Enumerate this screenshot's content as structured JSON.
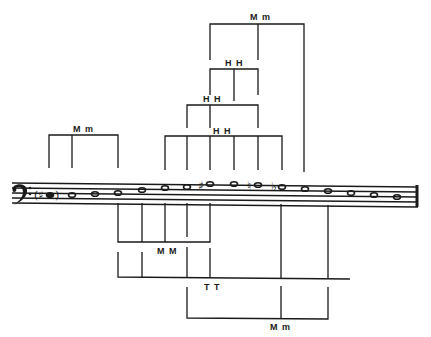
{
  "diagram": {
    "type": "music-interval-diagram",
    "clef": "bass",
    "ink_color": "#1a1a1a",
    "background": "#ffffff",
    "staff": {
      "x1": 12,
      "x2": 418,
      "lines_y": [
        183,
        188,
        193,
        198,
        203
      ]
    },
    "notes": [
      {
        "x": 50,
        "y": 195,
        "accidental": "(#)",
        "filled": true
      },
      {
        "x": 72,
        "y": 195,
        "accidental": ""
      },
      {
        "x": 95,
        "y": 194,
        "accidental": ""
      },
      {
        "x": 118,
        "y": 193,
        "accidental": ""
      },
      {
        "x": 142,
        "y": 191,
        "accidental": ""
      },
      {
        "x": 165,
        "y": 188,
        "accidental": ""
      },
      {
        "x": 187,
        "y": 187,
        "accidental": ""
      },
      {
        "x": 210,
        "y": 184,
        "accidental": "#"
      },
      {
        "x": 234,
        "y": 184,
        "accidental": ""
      },
      {
        "x": 258,
        "y": 185,
        "accidental": "natural"
      },
      {
        "x": 282,
        "y": 187,
        "accidental": "b"
      },
      {
        "x": 305,
        "y": 189,
        "accidental": ""
      },
      {
        "x": 328,
        "y": 191,
        "accidental": ""
      },
      {
        "x": 351,
        "y": 193,
        "accidental": ""
      },
      {
        "x": 374,
        "y": 195,
        "accidental": ""
      },
      {
        "x": 397,
        "y": 197,
        "accidental": ""
      }
    ],
    "labels": {
      "top_mm": "M m",
      "hh_top": "H H",
      "hh_mid": "H H",
      "hh_low": "H H",
      "left_mm": "M m",
      "below_mm_upper": "M M",
      "tt": "T T",
      "bottom_mm": "M m"
    },
    "brackets_above": [
      {
        "name": "left-mm",
        "y": 135,
        "xs": [
          49,
          72,
          118
        ],
        "bottom": 168,
        "label": "M m"
      },
      {
        "name": "top-mm",
        "y": 24,
        "xs": [
          210,
          258,
          304
        ],
        "bottom": 172,
        "label": "M m"
      },
      {
        "name": "hh-top",
        "y": 69,
        "xs": [
          210,
          234,
          258
        ],
        "bottom": 95,
        "label": "H H"
      },
      {
        "name": "hh-mid",
        "y": 105,
        "xs": [
          187,
          210,
          234,
          258
        ],
        "bottom": 128,
        "label": "H H"
      },
      {
        "name": "hh-low",
        "y": 136,
        "xs": [
          165,
          187,
          210,
          234,
          258,
          282
        ],
        "bottom": 170,
        "label": "H H"
      }
    ],
    "brackets_below": [
      {
        "name": "mm-upper",
        "y": 242,
        "xs": [
          118,
          142,
          165,
          187,
          210
        ],
        "top": 203,
        "label": "M M"
      },
      {
        "name": "tt",
        "y": 277,
        "xs": [
          118,
          142,
          187,
          210,
          281,
          328,
          418
        ],
        "top": 252,
        "label": "T T"
      },
      {
        "name": "mm-bottom",
        "y": 318,
        "xs": [
          187,
          281,
          328
        ],
        "top": 287,
        "label": "M m"
      }
    ]
  }
}
